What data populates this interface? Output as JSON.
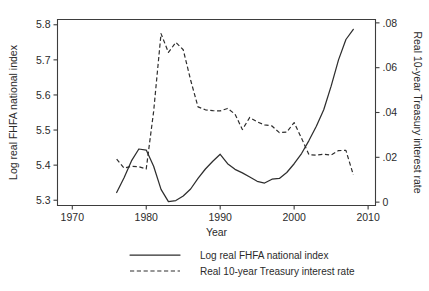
{
  "chart_data": {
    "type": "line",
    "title": "",
    "subtitle": "",
    "xlabel": "Year",
    "ylabel": "Log real FHFA national index",
    "y2label": "Real 10-year Treasury interest rate",
    "xlim": [
      1968,
      2011
    ],
    "ylim": [
      5.285,
      5.815
    ],
    "y2lim": [
      -0.0015,
      0.0815
    ],
    "grid": false,
    "legend_position": "bottom-center",
    "xticks": [
      1970,
      1980,
      1990,
      2000,
      2010
    ],
    "xtick_labels": [
      "1970",
      "1980",
      "1990",
      "2000",
      "2010"
    ],
    "yticks": [
      5.3,
      5.4,
      5.5,
      5.6,
      5.7,
      5.8
    ],
    "ytick_labels": [
      "5.3",
      "5.4",
      "5.5",
      "5.6",
      "5.7",
      "5.8"
    ],
    "y2ticks": [
      0,
      0.02,
      0.04,
      0.06,
      0.08
    ],
    "y2tick_labels": [
      "0",
      ".02",
      ".04",
      ".06",
      ".08"
    ],
    "series": [
      {
        "name": "Log real FHFA national index",
        "axis": "left",
        "style": "solid",
        "x": [
          1976,
          1977,
          1978,
          1979,
          1980,
          1981,
          1982,
          1983,
          1984,
          1985,
          1986,
          1987,
          1988,
          1989,
          1990,
          1991,
          1992,
          1993,
          1994,
          1995,
          1996,
          1997,
          1998,
          1999,
          2000,
          2001,
          2002,
          2003,
          2004,
          2005,
          2006,
          2007,
          2008
        ],
        "values": [
          5.322,
          5.364,
          5.412,
          5.446,
          5.443,
          5.397,
          5.331,
          5.296,
          5.299,
          5.312,
          5.332,
          5.362,
          5.389,
          5.411,
          5.431,
          5.404,
          5.388,
          5.378,
          5.366,
          5.354,
          5.349,
          5.36,
          5.362,
          5.379,
          5.404,
          5.433,
          5.47,
          5.511,
          5.558,
          5.625,
          5.7,
          5.758,
          5.787
        ],
        "values_note": "left-axis log index"
      },
      {
        "name": "Real 10-year Treasury interest rate",
        "axis": "right",
        "style": "dashed",
        "x": [
          1976,
          1977,
          1978,
          1979,
          1980,
          1981,
          1982,
          1983,
          1984,
          1985,
          1986,
          1987,
          1988,
          1989,
          1990,
          1991,
          1992,
          1993,
          1994,
          1995,
          1996,
          1997,
          1998,
          1999,
          2000,
          2001,
          2002,
          2003,
          2004,
          2005,
          2006,
          2007,
          2008
        ],
        "values": [
          0.0192,
          0.0152,
          0.016,
          0.0158,
          0.0148,
          0.0405,
          0.0752,
          0.0668,
          0.0713,
          0.068,
          0.0545,
          0.0425,
          0.0412,
          0.0408,
          0.0407,
          0.0418,
          0.0393,
          0.0324,
          0.0378,
          0.0358,
          0.0345,
          0.034,
          0.031,
          0.0313,
          0.0355,
          0.0285,
          0.0212,
          0.021,
          0.0214,
          0.021,
          0.023,
          0.0231,
          0.0122
        ],
        "values_note": "right-axis real rate"
      }
    ],
    "legend_entries": [
      {
        "label": "Log real FHFA national index",
        "style": "solid"
      },
      {
        "label": "Real 10-year Treasury interest rate",
        "style": "dashed"
      }
    ]
  },
  "colors": {
    "background": "#ffffff",
    "axis": "#3d3d3d",
    "text": "#2b2b2b",
    "line": "#2e2e2e"
  }
}
